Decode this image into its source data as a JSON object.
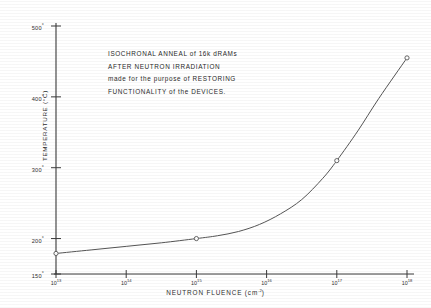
{
  "chart_data": {
    "type": "line",
    "title": "",
    "xlabel": "NEUTRON FLUENCE (cm",
    "xlabel_sup": "-2",
    "xlabel_tail": ")",
    "ylabel": "TEMPERATURE (°C)",
    "xscale": "log",
    "xlim": [
      13,
      18
    ],
    "ylim": [
      150,
      500
    ],
    "grid": false,
    "legend": "none",
    "x_ticks": [
      {
        "label": "10",
        "exponent": "13",
        "value": 13
      },
      {
        "label": "10",
        "exponent": "14",
        "value": 14
      },
      {
        "label": "10",
        "exponent": "15",
        "value": 15
      },
      {
        "label": "10",
        "exponent": "16",
        "value": 16
      },
      {
        "label": "10",
        "exponent": "17",
        "value": 17
      },
      {
        "label": "10",
        "exponent": "18",
        "value": 18
      }
    ],
    "y_ticks": [
      {
        "label": "500",
        "value": 500
      },
      {
        "label": "400",
        "value": 400
      },
      {
        "label": "300",
        "value": 300
      },
      {
        "label": "200",
        "value": 200
      },
      {
        "label": "150",
        "value": 150
      }
    ],
    "series": [
      {
        "name": "isochronal anneal temperature",
        "marker": "open-circle",
        "x": [
          13,
          15,
          17,
          18
        ],
        "y": [
          179,
          200,
          310,
          455
        ]
      }
    ],
    "curve_x": [
      13.0,
      13.5,
      14.0,
      14.5,
      15.0,
      15.3,
      15.6,
      15.9,
      16.2,
      16.5,
      16.8,
      17.0,
      17.3,
      17.6,
      18.0
    ],
    "curve_y": [
      179,
      184,
      189,
      194,
      200,
      204,
      210,
      220,
      235,
      255,
      285,
      310,
      352,
      398,
      455
    ]
  },
  "annotation": {
    "line1": "ISOCHRONAL  ANNEAL  of  16k   dRAMs",
    "line2": "AFTER  NEUTRON   IRRADIATION",
    "line3": "made  for  the  purpose  of  RESTORING",
    "line4": "FUNCTIONALITY   of   the   DEVICES."
  },
  "style": {
    "line_color": "#555555",
    "axis_color": "#3a3a3a",
    "text_color": "#2e2e2e",
    "background": "#ffffff"
  }
}
